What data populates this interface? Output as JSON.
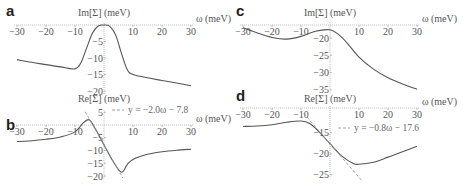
{
  "chart_data": [
    {
      "panel": "a",
      "type": "line",
      "title": "Im[Σ] (meV)",
      "xlabel": "ω (meV)",
      "ylabel": "Im[Σ] (meV)",
      "xlim": [
        -30,
        30
      ],
      "ylim": [
        -20,
        0
      ],
      "x_ticks": [
        -30,
        -20,
        -10,
        10,
        20,
        30
      ],
      "y_ticks": [
        -5,
        -10,
        -15,
        -20
      ],
      "grid": false,
      "series": [
        {
          "name": "Im[Σ]",
          "x": [
            -30,
            -25,
            -20,
            -15,
            -10,
            -8,
            -6,
            -4,
            -2,
            0,
            2,
            4,
            6,
            8,
            10,
            15,
            20,
            25,
            30
          ],
          "y": [
            -10.5,
            -11.3,
            -12.0,
            -12.7,
            -13.3,
            -11.5,
            -7.0,
            -2.5,
            -0.3,
            0,
            -0.4,
            -3.0,
            -8.5,
            -13.5,
            -15.0,
            -16.0,
            -16.8,
            -17.6,
            -18.4
          ]
        }
      ]
    },
    {
      "panel": "b",
      "type": "line",
      "title": "Re[Σ] (meV)",
      "xlabel": "ω (meV)",
      "ylabel": "Re[Σ] (meV)",
      "xlim": [
        -30,
        30
      ],
      "ylim": [
        -20,
        5
      ],
      "x_ticks": [
        -30,
        -20,
        -10,
        10,
        20,
        30
      ],
      "y_ticks": [
        5,
        -5,
        -10,
        -15,
        -20
      ],
      "grid": false,
      "legend": "y = −2.0ω − 7.8",
      "series": [
        {
          "name": "Re[Σ]",
          "x": [
            -30,
            -25,
            -20,
            -15,
            -10,
            -7,
            -5,
            -3,
            0,
            3,
            6,
            8,
            10,
            15,
            20,
            25,
            30
          ],
          "y": [
            -6.5,
            -6.2,
            -5.6,
            -4.7,
            -2.7,
            1.0,
            2.0,
            -1.5,
            -7.8,
            -14,
            -18.5,
            -15.5,
            -13.5,
            -11.5,
            -10.5,
            -9.9,
            -9.5
          ]
        },
        {
          "name": "fit",
          "style": "dashed",
          "slope": -2.0,
          "intercept": -7.8,
          "x": [
            -6.5,
            6.5
          ]
        }
      ]
    },
    {
      "panel": "c",
      "type": "line",
      "title": "Im[Σ] (meV)",
      "xlabel": "ω (meV)",
      "ylabel": "Im[Σ] (meV)",
      "xlim": [
        -30,
        30
      ],
      "ylim": [
        -35,
        -16
      ],
      "x_ticks": [
        -30,
        -20,
        -10,
        10,
        20,
        30
      ],
      "y_ticks": [
        -20,
        -25,
        -30,
        -35
      ],
      "grid": false,
      "series": [
        {
          "name": "Im[Σ]",
          "x": [
            -30,
            -25,
            -20,
            -15,
            -10,
            -5,
            0,
            3,
            6,
            10,
            15,
            20,
            25,
            30
          ],
          "y": [
            -17.0,
            -18.5,
            -19.8,
            -20.3,
            -19.5,
            -18.0,
            -17.6,
            -19.0,
            -21.5,
            -25.5,
            -29.0,
            -31.5,
            -33.3,
            -34.8
          ]
        }
      ]
    },
    {
      "panel": "d",
      "type": "line",
      "title": "Re[Σ] (meV)",
      "xlabel": "ω (meV)",
      "ylabel": "Re[Σ] (meV)",
      "xlim": [
        -30,
        30
      ],
      "ylim": [
        -25,
        -10
      ],
      "x_ticks": [
        -30,
        -20,
        -10,
        10,
        20,
        30
      ],
      "y_ticks": [
        -15,
        -20,
        -25
      ],
      "grid": false,
      "legend": "y = −0.8ω − 17.6",
      "series": [
        {
          "name": "Re[Σ]",
          "x": [
            -30,
            -25,
            -20,
            -15,
            -10,
            -7,
            -4,
            0,
            4,
            8,
            10,
            15,
            20,
            25,
            30
          ],
          "y": [
            -13.5,
            -13.4,
            -13.1,
            -12.5,
            -12.2,
            -12.8,
            -14.6,
            -17.6,
            -20.5,
            -22.3,
            -22.5,
            -22.0,
            -20.8,
            -19.5,
            -18.2
          ]
        },
        {
          "name": "fit",
          "style": "dashed",
          "slope": -0.8,
          "intercept": -17.6,
          "x": [
            -9,
            11
          ]
        }
      ]
    }
  ],
  "figure": {
    "panel_labels": [
      "a",
      "b",
      "c",
      "d"
    ],
    "line_color": "#555555",
    "axis_color": "#aaaaaa",
    "fit_color": "#999999"
  }
}
